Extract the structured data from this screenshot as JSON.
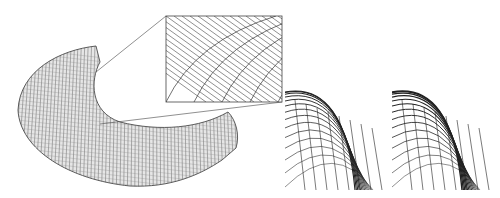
{
  "figure": {
    "panels": [
      {
        "id": "main",
        "description": "curved strip mesh surface with zoomed inset"
      },
      {
        "id": "detail-a",
        "description": "corner detail of mesh, variant A"
      },
      {
        "id": "detail-b",
        "description": "corner detail of mesh, variant B"
      }
    ],
    "colors": {
      "line": "#222222",
      "mesh": "#555555",
      "background": "#ffffff",
      "inset_border": "#444444"
    }
  }
}
